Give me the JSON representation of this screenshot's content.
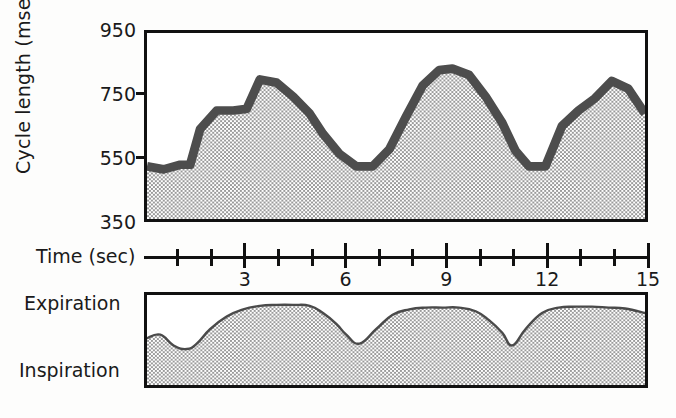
{
  "figure": {
    "title": "",
    "upper_panel_name": "cycle-length-trace",
    "lower_panel_name": "respiration-trace"
  },
  "chart_data": [
    {
      "type": "line",
      "name": "cycle-length",
      "title": "",
      "xlabel": "Time (sec)",
      "ylabel": "Cycle length (msec)",
      "xlim": [
        0,
        15
      ],
      "ylim": [
        350,
        950
      ],
      "yticks": [
        350,
        550,
        750,
        950
      ],
      "ytick_labels": [
        "350",
        "550",
        "750",
        "950"
      ],
      "xticks": [
        1,
        2,
        3,
        4,
        5,
        6,
        7,
        8,
        9,
        10,
        11,
        12,
        13,
        14,
        15
      ],
      "xtick_major": [
        3,
        6,
        9,
        12,
        15
      ],
      "xtick_labels": [
        "3",
        "6",
        "9",
        "12",
        "15"
      ],
      "grid": false,
      "legend": "none",
      "fill": "stipple-gray",
      "line_style": "thick-dark-gray",
      "x": [
        0.0,
        0.5,
        1.0,
        1.3,
        1.6,
        2.1,
        2.6,
        3.0,
        3.4,
        3.9,
        4.4,
        4.9,
        5.3,
        5.8,
        6.3,
        6.8,
        7.3,
        7.8,
        8.3,
        8.8,
        9.2,
        9.7,
        10.2,
        10.7,
        11.1,
        11.5,
        12.0,
        12.5,
        13.0,
        13.5,
        14.0,
        14.5,
        15.0
      ],
      "y": [
        520,
        510,
        525,
        525,
        640,
        700,
        700,
        705,
        800,
        790,
        745,
        690,
        625,
        560,
        520,
        520,
        575,
        680,
        780,
        830,
        835,
        815,
        745,
        660,
        570,
        520,
        520,
        650,
        700,
        740,
        795,
        770,
        690,
        600
      ]
    },
    {
      "type": "area",
      "name": "respiration",
      "title": "",
      "xlabel": "",
      "ylabel": "",
      "upper_label": "Expiration",
      "lower_label": "Inspiration",
      "xlim": [
        0,
        15
      ],
      "grid": false,
      "legend": "none",
      "fill": "stipple-gray",
      "line_style": "thin-dark",
      "x": [
        0.0,
        0.4,
        0.8,
        1.2,
        1.5,
        1.9,
        2.4,
        2.9,
        3.4,
        3.9,
        4.4,
        4.9,
        5.3,
        5.7,
        6.0,
        6.4,
        6.9,
        7.4,
        7.9,
        8.4,
        8.9,
        9.4,
        9.9,
        10.3,
        10.7,
        11.0,
        11.4,
        11.9,
        12.4,
        12.9,
        13.4,
        13.9,
        14.4,
        15.0
      ],
      "y_relative": [
        0.52,
        0.56,
        0.44,
        0.4,
        0.46,
        0.62,
        0.76,
        0.84,
        0.88,
        0.89,
        0.89,
        0.88,
        0.8,
        0.68,
        0.56,
        0.46,
        0.62,
        0.78,
        0.84,
        0.86,
        0.86,
        0.86,
        0.82,
        0.72,
        0.58,
        0.44,
        0.62,
        0.8,
        0.86,
        0.87,
        0.87,
        0.86,
        0.85,
        0.8
      ]
    }
  ],
  "axes": {
    "y_title": "Cycle length (msec)",
    "y_ticks": [
      {
        "label": "950",
        "value": 950
      },
      {
        "label": "750",
        "value": 750
      },
      {
        "label": "550",
        "value": 550
      },
      {
        "label": "350",
        "value": 350
      }
    ],
    "x_title": "Time (sec)",
    "x_tick_labels": [
      {
        "label": "3",
        "value": 3
      },
      {
        "label": "6",
        "value": 6
      },
      {
        "label": "9",
        "value": 9
      },
      {
        "label": "12",
        "value": 12
      },
      {
        "label": "15",
        "value": 15
      }
    ]
  },
  "respiration_labels": {
    "expiration": "Expiration",
    "inspiration": "Inspiration"
  },
  "colors": {
    "ink": "#111111",
    "trace_line": "#4d4d4d",
    "fill_gray": "#c9c9c9",
    "paper": "#ffffff"
  }
}
